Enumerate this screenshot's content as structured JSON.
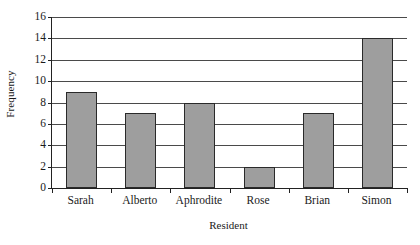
{
  "chart_data": {
    "type": "bar",
    "title": "",
    "subtitle": "",
    "xlabel": "Resident",
    "ylabel": "Frequency",
    "categories": [
      "Sarah",
      "Alberto",
      "Aphrodite",
      "Rose",
      "Brian",
      "Simon"
    ],
    "values": [
      9,
      7,
      8,
      2,
      7,
      14
    ],
    "ylim": [
      0,
      16
    ],
    "yticks": [
      0,
      2,
      4,
      6,
      8,
      10,
      12,
      14,
      16
    ],
    "ytick_labels": [
      "0",
      "2",
      "4",
      "6",
      "8",
      "10",
      "12",
      "14",
      "16"
    ],
    "grid": true,
    "grid_axis": "y",
    "legend": false,
    "legend_position": "none",
    "bar_fill_color": "#9e9e9e",
    "bar_border_color": "#2a2a2a",
    "gridline_color": "#4a4a4a",
    "axis_color": "#222222",
    "background_color": "#ffffff",
    "series": [
      {
        "name": "Frequency",
        "values": [
          9,
          7,
          8,
          2,
          7,
          14
        ]
      }
    ]
  }
}
